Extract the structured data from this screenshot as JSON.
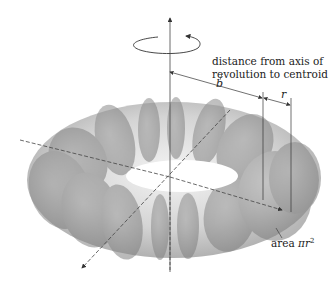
{
  "figure": {
    "labels": {
      "distance_line1": "distance from axis of",
      "distance_line2": "revolution to centroid",
      "b": "b",
      "r": "r",
      "area_word": "area",
      "area_expr": "πr",
      "area_exp": "2"
    },
    "elements": [
      "rotation-arrow-ellipse",
      "vertical-axis-of-revolution",
      "diagonal-axis-x",
      "diagonal-axis-y",
      "dimension-b",
      "dimension-r",
      "cross-section-circles"
    ],
    "colors": {
      "line": "#333333",
      "torus_light": "#e6e6e6",
      "torus_dark": "#8a8a8a",
      "background": "#ffffff"
    }
  }
}
